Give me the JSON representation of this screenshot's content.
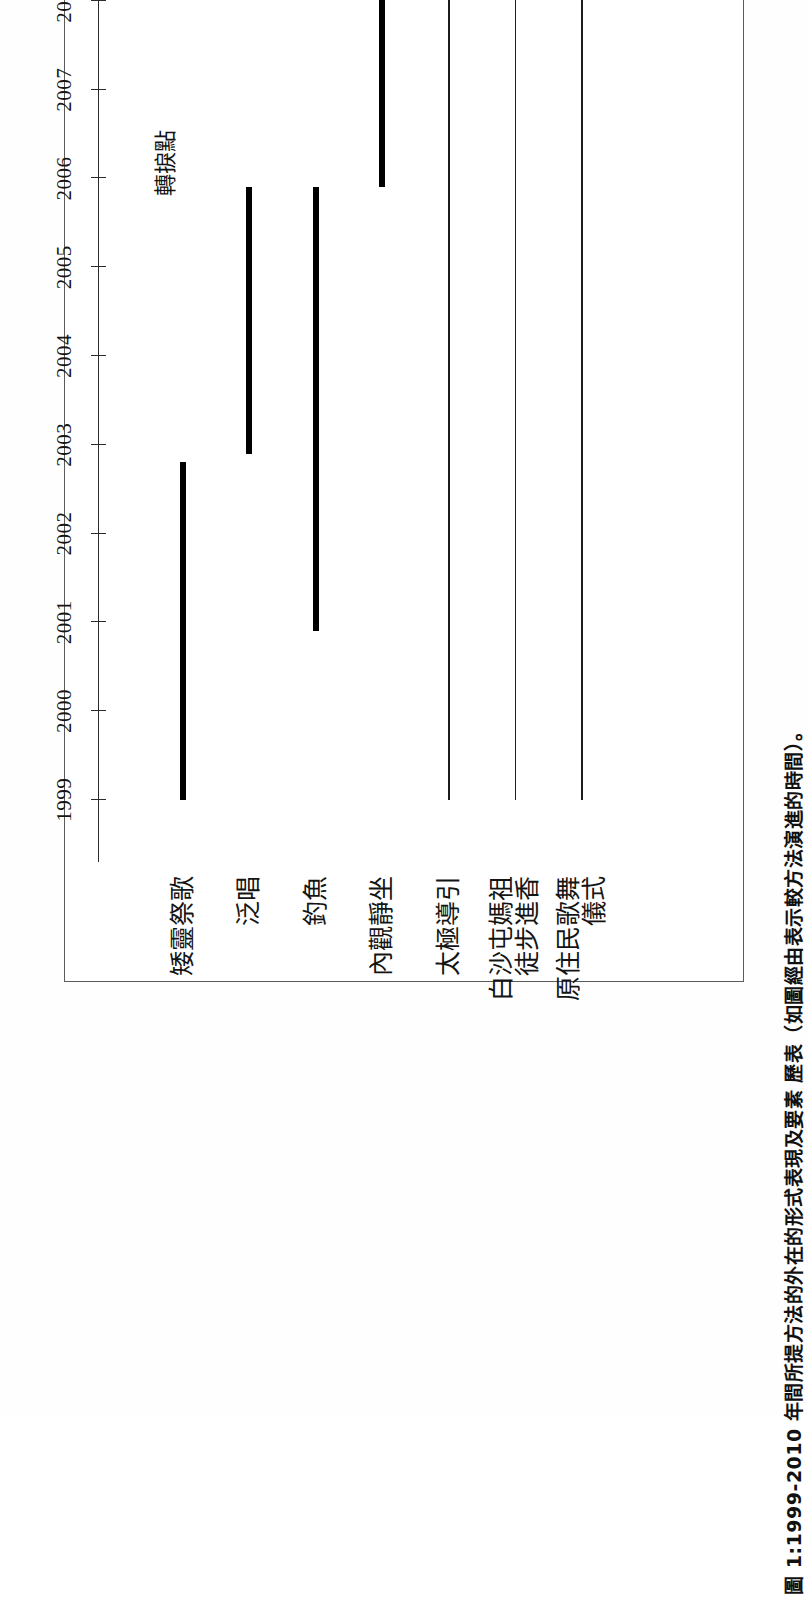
{
  "figure": {
    "caption": "圖 1:1999-2010 年間所提方法的外在的形式表現及要素  歷表（如圖經由表示較方法演進的時間）。",
    "annotation": {
      "label": "轉捩點",
      "year": 2006
    }
  },
  "chart_data": {
    "type": "bar",
    "orientation": "horizontal-gantt",
    "title": "",
    "xlabel": "",
    "ylabel": "",
    "xlim": [
      1998.3,
      2010.6
    ],
    "grid": false,
    "legend": "none",
    "tick_labels": [
      "1999",
      "2000",
      "2001",
      "2002",
      "2003",
      "2004",
      "2005",
      "2006",
      "2007",
      "2008",
      "2009",
      "2010"
    ],
    "tick_values": [
      1999,
      2000,
      2001,
      2002,
      2003,
      2004,
      2005,
      2006,
      2007,
      2008,
      2009,
      2010
    ],
    "categories": [
      "矮靈祭歌",
      "泛唱",
      "釣魚",
      "內觀靜坐",
      "太極導引",
      "白沙屯媽祖徒步進香",
      "原住民歌舞儀式"
    ],
    "bars": [
      {
        "label": "矮靈祭歌",
        "label_line1": "矮靈祭歌",
        "label_line2": "",
        "start": 1999.0,
        "end": 2002.8,
        "weight": "thick"
      },
      {
        "label": "泛唱",
        "label_line1": "泛唱",
        "label_line2": "",
        "start": 2002.9,
        "end": 2005.9,
        "weight": "thick"
      },
      {
        "label": "釣魚",
        "label_line1": "釣魚",
        "label_line2": "",
        "start": 2000.9,
        "end": 2005.9,
        "weight": "thick"
      },
      {
        "label": "內觀靜坐",
        "label_line1": "內觀靜坐",
        "label_line2": "",
        "start": 2005.9,
        "end": 2010.0,
        "weight": "thick"
      },
      {
        "label": "太極導引",
        "label_line1": "太極導引",
        "label_line2": "",
        "start": 1999.0,
        "end": 2010.0,
        "weight": "thin"
      },
      {
        "label": "白沙屯媽祖徒步進香",
        "label_line1": "白沙屯媽祖",
        "label_line2": "徒步進香",
        "start": 1999.0,
        "end": 2010.0,
        "weight": "thin"
      },
      {
        "label": "原住民歌舞儀式",
        "label_line1": "原住民歌舞",
        "label_line2": "儀式",
        "start": 1999.0,
        "end": 2010.0,
        "weight": "thin"
      }
    ]
  }
}
